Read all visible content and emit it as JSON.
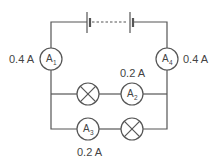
{
  "diagram": {
    "type": "circuit",
    "battery": {
      "label": "",
      "cells": 2,
      "dashed_link": true
    },
    "ammeters": [
      {
        "id": "A1",
        "symbol": "A",
        "subscript": "1",
        "reading": "0.4 A"
      },
      {
        "id": "A2",
        "symbol": "A",
        "subscript": "2",
        "reading": "0.2 A"
      },
      {
        "id": "A3",
        "symbol": "A",
        "subscript": "3",
        "reading": "0.2 A"
      },
      {
        "id": "A4",
        "symbol": "A",
        "subscript": "4",
        "reading": "0.4 A"
      }
    ],
    "lamps": [
      {
        "id": "lamp-1",
        "branch": "upper"
      },
      {
        "id": "lamp-2",
        "branch": "lower"
      }
    ],
    "colors": {
      "wire": "#555555",
      "text": "#444444",
      "background": "#ffffff"
    }
  }
}
